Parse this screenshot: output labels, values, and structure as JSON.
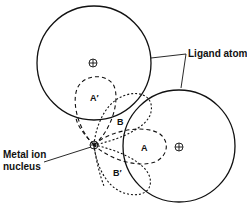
{
  "diagram": {
    "labels": {
      "ligand_atoms": "Ligand atoms",
      "metal_ion_line1": "Metal ion",
      "metal_ion_line2": "nucleus",
      "orbital_A": "A",
      "orbital_A_prime": "A′",
      "orbital_B": "B",
      "orbital_B_prime": "B′"
    },
    "elements": {
      "ligand_atom_upper": {
        "cx": 94,
        "cy": 63,
        "r": 57
      },
      "ligand_atom_lower": {
        "cx": 179,
        "cy": 146,
        "r": 56
      },
      "metal_nucleus": {
        "cx": 94,
        "cy": 145
      }
    },
    "colors": {
      "line": "#111111",
      "background": "#ffffff"
    }
  }
}
